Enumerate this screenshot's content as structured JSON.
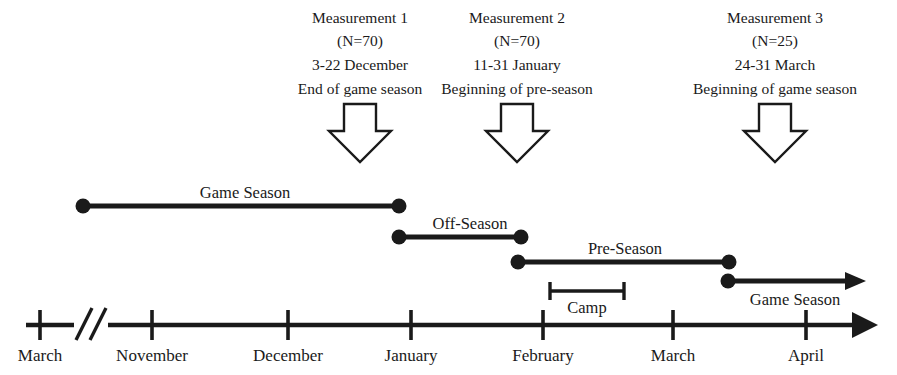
{
  "figure": {
    "background_color": "#ffffff",
    "ink_color": "#1a1a1a"
  },
  "measurements": [
    {
      "name": "Measurement 1",
      "sample": "(N=70)",
      "dates": "3-22 December",
      "phase": "End of game season",
      "center_x": 360
    },
    {
      "name": "Measurement 2",
      "sample": "(N=70)",
      "dates": "11-31 January",
      "phase": "Beginning of pre-season",
      "center_x": 517
    },
    {
      "name": "Measurement 3",
      "sample": "(N=25)",
      "dates": "24-31 March",
      "phase": "Beginning of game season",
      "center_x": 775
    }
  ],
  "bands": [
    {
      "label": "Game Season",
      "start_x": 82,
      "end_x": 400,
      "y": 206,
      "label_x": 245,
      "label_y": 198,
      "end_style": "dot"
    },
    {
      "label": "Off-Season",
      "start_x": 398,
      "end_x": 522,
      "y": 237,
      "label_x": 470,
      "label_y": 229,
      "end_style": "dot"
    },
    {
      "label": "Pre-Season",
      "start_x": 517,
      "end_x": 730,
      "y": 262,
      "label_x": 625,
      "label_y": 254,
      "end_style": "dot"
    },
    {
      "label": "Game Season",
      "start_x": 727,
      "end_x": 862,
      "y": 281,
      "label_x": 795,
      "label_y": 305,
      "end_style": "arrow"
    }
  ],
  "camp": {
    "label": "Camp",
    "start_x": 549,
    "end_x": 625,
    "y": 291,
    "label_x": 587,
    "label_y": 312
  },
  "axis": {
    "y": 325,
    "start_x": 26,
    "end_x": 872,
    "break_x": 84,
    "ticks": [
      {
        "label": "March",
        "x": 40,
        "label_x": 40
      },
      {
        "label": "November",
        "x": 152,
        "label_x": 152
      },
      {
        "label": "December",
        "x": 288,
        "label_x": 288
      },
      {
        "label": "January",
        "x": 411,
        "label_x": 411
      },
      {
        "label": "February",
        "x": 543,
        "label_x": 543
      },
      {
        "label": "March",
        "x": 673,
        "label_x": 673
      },
      {
        "label": "April",
        "x": 806,
        "label_x": 806
      }
    ],
    "label_y": 355
  },
  "down_arrows": [
    {
      "center_x": 360,
      "top_y": 103,
      "bottom_y": 163
    },
    {
      "center_x": 517,
      "top_y": 103,
      "bottom_y": 163
    },
    {
      "center_x": 775,
      "top_y": 103,
      "bottom_y": 163
    }
  ]
}
